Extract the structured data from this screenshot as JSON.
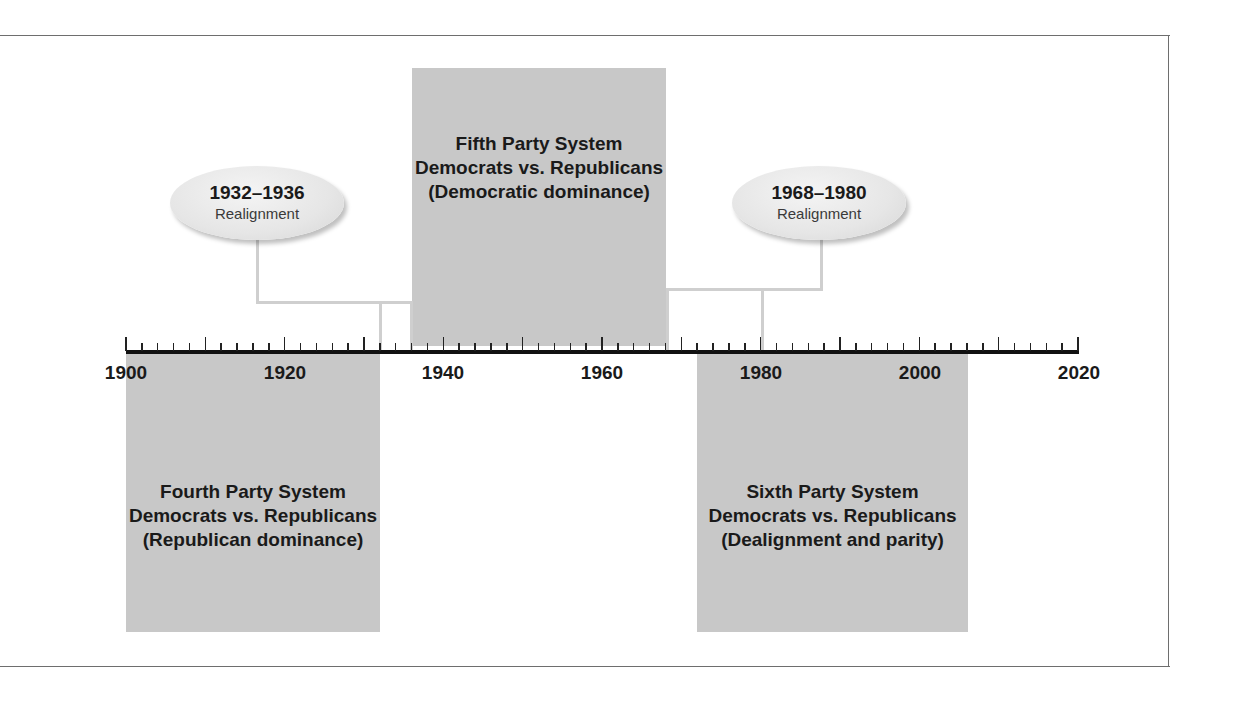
{
  "chart_data": {
    "type": "timeline",
    "title": "",
    "axis": {
      "start": 1900,
      "end": 2020,
      "major_tick_interval": 10,
      "minor_tick_interval": 2,
      "tick_labels": [
        "1900",
        "1920",
        "1940",
        "1960",
        "1980",
        "2000",
        "2020"
      ]
    },
    "periods": [
      {
        "name": "Fourth Party System",
        "parties": "Democrats vs. Republicans",
        "note": "(Republican dominance)",
        "start": 1900,
        "end": 1932,
        "position": "below"
      },
      {
        "name": "Fifth Party System",
        "parties": "Democrats vs. Republicans",
        "note": "(Democratic dominance)",
        "start": 1936,
        "end": 1968,
        "position": "above"
      },
      {
        "name": "Sixth Party System",
        "parties": "Democrats vs. Republicans",
        "note": "(Dealignment and parity)",
        "start": 1972,
        "end": 2006,
        "position": "below"
      }
    ],
    "events": [
      {
        "years": "1932–1936",
        "label": "Realignment",
        "start": 1932,
        "end": 1936
      },
      {
        "years": "1968–1980",
        "label": "Realignment",
        "start": 1968,
        "end": 1980
      }
    ]
  },
  "colors": {
    "box_fill": "#c8c8c8",
    "connector": "#cfcfcf",
    "axis": "#111111",
    "frame": "#6e6e6e"
  }
}
